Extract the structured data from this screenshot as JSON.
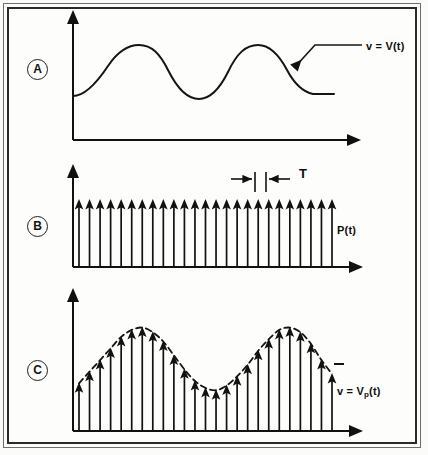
{
  "figure": {
    "background_color": "#fdfdfb",
    "ink_color": "#111111",
    "frame": {
      "outer_color": "#6f6f6f",
      "inner_color": "#2a2a2a"
    }
  },
  "panels": [
    {
      "tag": "A",
      "label": "v = V(t)",
      "kind": "continuous-waveform",
      "annotation": "leader line with arrowhead pointing to the waveform"
    },
    {
      "tag": "B",
      "label": "P(t)",
      "kind": "impulse-train",
      "period_label": "T",
      "impulse_count": 25
    },
    {
      "tag": "C",
      "label_parts": {
        "lhs": "v  =  V",
        "sub": "p",
        "rhs": "(t)"
      },
      "label": "v = Vp(t)",
      "kind": "sampled-impulse-train",
      "impulse_count": 25,
      "envelope": "dashed sinusoid"
    }
  ],
  "chart_data": [
    {
      "type": "line",
      "panel": "A",
      "title": "v = V(t)",
      "xlabel": "t",
      "ylabel": "v",
      "grid": false,
      "legend": "none",
      "xlim": [
        0,
        1
      ],
      "ylim": [
        0,
        1
      ],
      "series": [
        {
          "name": "V(t)",
          "x": [
            0.0,
            0.06,
            0.13,
            0.2,
            0.26,
            0.33,
            0.4,
            0.46,
            0.53,
            0.6,
            0.66,
            0.73,
            0.8,
            0.86,
            0.93,
            1.0
          ],
          "y": [
            0.42,
            0.56,
            0.74,
            0.86,
            0.88,
            0.8,
            0.62,
            0.46,
            0.38,
            0.4,
            0.56,
            0.76,
            0.88,
            0.86,
            0.68,
            0.42
          ]
        }
      ],
      "annotations": [
        {
          "text": "v = V(t)",
          "kind": "leader-arrow",
          "points_to": "descending edge of second cycle"
        }
      ]
    },
    {
      "type": "bar",
      "panel": "B",
      "title": "P(t)",
      "xlabel": "t",
      "ylabel": "P",
      "grid": false,
      "legend": "none",
      "note": "uniform impulse train, all samples equal amplitude",
      "categories": [
        "1",
        "2",
        "3",
        "4",
        "5",
        "6",
        "7",
        "8",
        "9",
        "10",
        "11",
        "12",
        "13",
        "14",
        "15",
        "16",
        "17",
        "18",
        "19",
        "20",
        "21",
        "22",
        "23",
        "24",
        "25"
      ],
      "values": [
        1,
        1,
        1,
        1,
        1,
        1,
        1,
        1,
        1,
        1,
        1,
        1,
        1,
        1,
        1,
        1,
        1,
        1,
        1,
        1,
        1,
        1,
        1,
        1,
        1
      ],
      "ylim": [
        0,
        1.25
      ],
      "annotations": [
        {
          "text": "T",
          "kind": "period-dimension",
          "between_samples": [
            19,
            20
          ]
        }
      ]
    },
    {
      "type": "bar",
      "panel": "C",
      "title": "v = Vp(t)",
      "xlabel": "t",
      "ylabel": "v",
      "grid": false,
      "legend": "none",
      "note": "impulse train amplitude-modulated by V(t); dashed curve is the envelope",
      "categories": [
        "1",
        "2",
        "3",
        "4",
        "5",
        "6",
        "7",
        "8",
        "9",
        "10",
        "11",
        "12",
        "13",
        "14",
        "15",
        "16",
        "17",
        "18",
        "19",
        "20",
        "21",
        "22",
        "23",
        "24",
        "25"
      ],
      "values": [
        0.42,
        0.52,
        0.62,
        0.72,
        0.82,
        0.88,
        0.9,
        0.86,
        0.78,
        0.66,
        0.54,
        0.44,
        0.38,
        0.36,
        0.4,
        0.48,
        0.58,
        0.7,
        0.8,
        0.88,
        0.9,
        0.86,
        0.76,
        0.62,
        0.5
      ],
      "ylim": [
        0,
        1.1
      ],
      "envelope": {
        "style": "dashed",
        "x": [
          0.0,
          0.06,
          0.13,
          0.2,
          0.26,
          0.33,
          0.4,
          0.46,
          0.53,
          0.6,
          0.66,
          0.73,
          0.8,
          0.86,
          0.93,
          1.0
        ],
        "y": [
          0.42,
          0.56,
          0.74,
          0.86,
          0.9,
          0.8,
          0.62,
          0.46,
          0.37,
          0.4,
          0.56,
          0.76,
          0.89,
          0.86,
          0.66,
          0.46
        ]
      }
    }
  ]
}
